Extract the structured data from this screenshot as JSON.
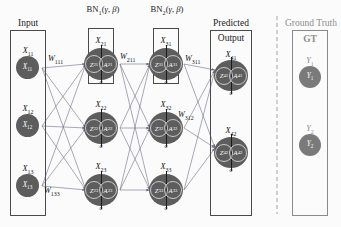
{
  "diagram": {
    "colors": {
      "node_fill": "#5d5d5d",
      "box_border": "#4a4a4a",
      "gt_border": "#8a8a8a",
      "gt_text": "#8d8d8d",
      "edge": "#6e6e8a",
      "text": "#111111"
    }
  },
  "layers": {
    "input": {
      "caption": "Input",
      "nodes": [
        {
          "label": "X11",
          "inner": "X11"
        },
        {
          "label": "X12",
          "inner": "X12"
        },
        {
          "label": "X13",
          "inner": "X13"
        }
      ]
    },
    "hidden1": {
      "bn_label": "BN1(γ, β)",
      "nodes": [
        {
          "label": "X21",
          "z": "Z21",
          "a": "A21",
          "activation": "σ"
        },
        {
          "label": "X22",
          "z": "Z22",
          "a": "A22",
          "activation": "σ"
        },
        {
          "label": "X23",
          "z": "Z23",
          "a": "A23",
          "activation": "σ"
        }
      ]
    },
    "hidden2": {
      "bn_label": "BN2(γ, β)",
      "nodes": [
        {
          "label": "X31",
          "z": "Z31",
          "a": "A31",
          "activation": "σ"
        },
        {
          "label": "X32",
          "z": "Z32",
          "a": "A32",
          "activation": "σ"
        },
        {
          "label": "X33",
          "z": "Z33",
          "a": "A33",
          "activation": "σ"
        }
      ]
    },
    "output": {
      "caption_top": "Predicted",
      "caption_inner": "Output",
      "nodes": [
        {
          "label": "X41",
          "z": "Z41",
          "a": "A41",
          "activation": "σ"
        },
        {
          "label": "X42",
          "z": "Z42",
          "a": "A42",
          "activation": "σ"
        }
      ]
    },
    "ground_truth": {
      "caption_top": "Ground Truth",
      "caption_inner": "GT",
      "nodes": [
        {
          "label": "Y1",
          "inner": "Y1"
        },
        {
          "label": "Y2",
          "inner": "Y2"
        }
      ]
    }
  },
  "weights": {
    "w111": "W111",
    "w133": "W133",
    "w211": "W211",
    "w311": "W311",
    "w312": "W312"
  }
}
